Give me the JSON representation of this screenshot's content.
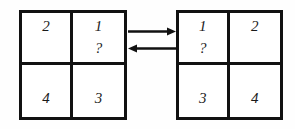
{
  "diagram": {
    "type": "two-by-two-grid-pair-with-bidirectional-arrows",
    "background_color": "#fefefe",
    "line_color": "#111111",
    "text_color": "#1a1a1a",
    "grids": [
      {
        "id": "left",
        "name": "left-grid",
        "cells": [
          {
            "position": "top-left",
            "label": "2",
            "query": ""
          },
          {
            "position": "top-right",
            "label": "1",
            "query": "?"
          },
          {
            "position": "bottom-left",
            "label": "4",
            "query": ""
          },
          {
            "position": "bottom-right",
            "label": "3",
            "query": ""
          }
        ]
      },
      {
        "id": "right",
        "name": "right-grid",
        "cells": [
          {
            "position": "top-left",
            "label": "1",
            "query": "?"
          },
          {
            "position": "top-right",
            "label": "2",
            "query": ""
          },
          {
            "position": "bottom-left",
            "label": "3",
            "query": ""
          },
          {
            "position": "bottom-right",
            "label": "4",
            "query": ""
          }
        ]
      }
    ],
    "arrows": [
      {
        "name": "arrow-right",
        "direction": "right",
        "glyph": "→"
      },
      {
        "name": "arrow-left",
        "direction": "left",
        "glyph": "←"
      }
    ]
  }
}
